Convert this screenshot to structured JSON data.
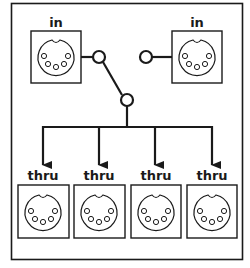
{
  "diagram": {
    "colors": {
      "line": "#1a1a1a",
      "background": "#ffffff"
    },
    "inputs": [
      {
        "label": "in",
        "position": "left"
      },
      {
        "label": "in",
        "position": "right"
      }
    ],
    "switch": {
      "type": "single-pole double-throw",
      "selected": "left"
    },
    "outputs": [
      {
        "label": "thru"
      },
      {
        "label": "thru"
      },
      {
        "label": "thru"
      },
      {
        "label": "thru"
      }
    ],
    "connector_icon": "midi-din-5pin-icon"
  }
}
